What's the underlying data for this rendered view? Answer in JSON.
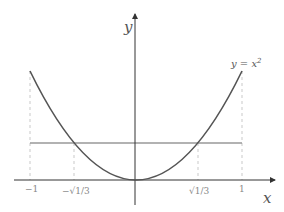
{
  "figure": {
    "type": "function-plot",
    "function_label": "y = x²",
    "axes": {
      "x_label": "x",
      "y_label": "y"
    },
    "x_ticks": [
      {
        "value": -1,
        "label": "−1"
      },
      {
        "value": -0.57735,
        "label": "−√1/3"
      },
      {
        "value": 0.57735,
        "label": "√1/3"
      },
      {
        "value": 1,
        "label": "1"
      }
    ],
    "horizontal_line": {
      "y": 0.3333,
      "description": "y = 1/3"
    },
    "domain": [
      -1,
      1
    ],
    "colors": {
      "curve": "#555555",
      "hline": "#999999",
      "axes": "#333333",
      "guides": "#bbbbbb"
    }
  }
}
